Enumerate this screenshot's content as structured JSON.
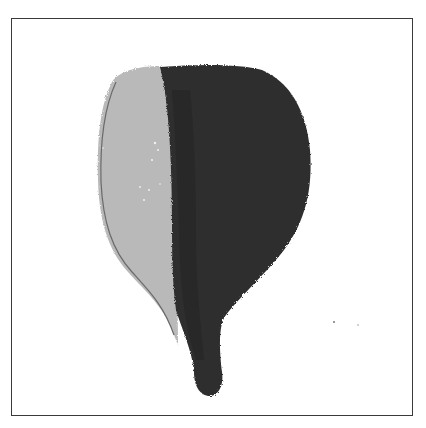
{
  "image": {
    "subject": "watercolor bulb / fig shape, half light gray and half dark gray",
    "colors": {
      "frame": "#3a3a3a",
      "background": "#ffffff",
      "light_half": "#b9b9b9",
      "dark_half": "#2e2e2e",
      "outline": "#6a6a6a"
    }
  }
}
